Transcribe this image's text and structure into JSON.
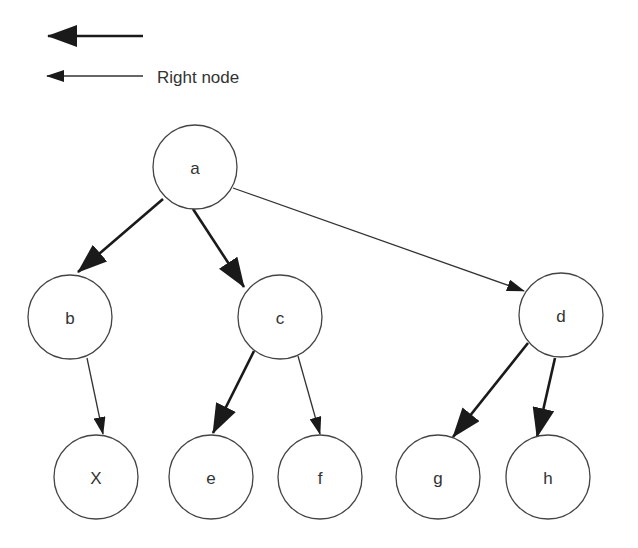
{
  "legend": {
    "items": [
      {
        "style": "thick",
        "label": ""
      },
      {
        "style": "thin",
        "label": "Right node"
      }
    ]
  },
  "nodes": {
    "a": {
      "label": "a"
    },
    "b": {
      "label": "b"
    },
    "c": {
      "label": "c"
    },
    "d": {
      "label": "d"
    },
    "x": {
      "label": "X"
    },
    "e": {
      "label": "e"
    },
    "f": {
      "label": "f"
    },
    "g": {
      "label": "g"
    },
    "h": {
      "label": "h"
    }
  },
  "edges": [
    {
      "from": "a",
      "to": "b",
      "style": "thick"
    },
    {
      "from": "a",
      "to": "c",
      "style": "thick"
    },
    {
      "from": "a",
      "to": "d",
      "style": "thin"
    },
    {
      "from": "b",
      "to": "X",
      "style": "thin"
    },
    {
      "from": "c",
      "to": "e",
      "style": "thick"
    },
    {
      "from": "c",
      "to": "f",
      "style": "thin"
    },
    {
      "from": "d",
      "to": "g",
      "style": "thick"
    },
    {
      "from": "d",
      "to": "h",
      "style": "thick"
    }
  ],
  "colors": {
    "stroke": "#444444",
    "arrow": "#1a1a1a",
    "text": "#333333",
    "background": "#ffffff"
  }
}
